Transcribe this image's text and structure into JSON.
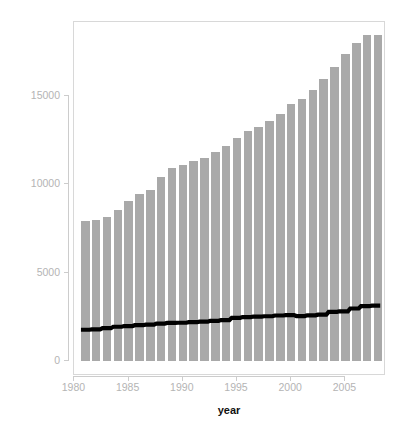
{
  "chart_data": {
    "type": "bar",
    "title": "",
    "xlabel": "year",
    "ylabel": "Electricity Production (TWh)",
    "x": [
      1981,
      1982,
      1983,
      1984,
      1985,
      1986,
      1987,
      1988,
      1989,
      1990,
      1991,
      1992,
      1993,
      1994,
      1995,
      1996,
      1997,
      1998,
      1999,
      2000,
      2001,
      2002,
      2003,
      2004,
      2005,
      2006,
      2007,
      2008
    ],
    "categories": [
      "1981",
      "1982",
      "1983",
      "1984",
      "1985",
      "1986",
      "1987",
      "1988",
      "1989",
      "1990",
      "1991",
      "1992",
      "1993",
      "1994",
      "1995",
      "1996",
      "1997",
      "1998",
      "1999",
      "2000",
      "2001",
      "2002",
      "2003",
      "2004",
      "2005",
      "2006",
      "2007",
      "2008"
    ],
    "series": [
      {
        "name": "Total electricity production",
        "render": "bar",
        "color": "#a9a9a9",
        "values": [
          7950,
          8000,
          8130,
          8550,
          9050,
          9430,
          9700,
          10400,
          10950,
          11100,
          11330,
          11500,
          11850,
          12150,
          12600,
          13000,
          13250,
          13600,
          14000,
          14550,
          14850,
          15350,
          15950,
          16650,
          17350,
          18000,
          18450,
          18450
        ]
      },
      {
        "name": "Trend line",
        "render": "line",
        "color": "#000000",
        "values": [
          1670,
          1690,
          1760,
          1840,
          1880,
          1930,
          1960,
          2020,
          2060,
          2070,
          2100,
          2130,
          2180,
          2220,
          2350,
          2390,
          2420,
          2440,
          2480,
          2500,
          2450,
          2490,
          2530,
          2690,
          2720,
          2880,
          3010,
          3040
        ]
      }
    ],
    "xlim": [
      1980,
      2009
    ],
    "ylim": [
      0,
      18900
    ],
    "yticks": [
      0,
      5000,
      10000,
      15000
    ],
    "ytick_labels": [
      "0",
      "5000",
      "10000",
      "15000"
    ],
    "xticks": [
      1980,
      1985,
      1990,
      1995,
      2000,
      2005
    ],
    "xtick_labels": [
      "1980",
      "1985",
      "1990",
      "1995",
      "2000",
      "2005"
    ],
    "grid": false,
    "legend": "none",
    "frame": true,
    "background_color": "#ffffff",
    "axis_text_color": "#b4b4b4",
    "axis_title_color": "#111111",
    "frame_color": "#d8d8d8"
  }
}
